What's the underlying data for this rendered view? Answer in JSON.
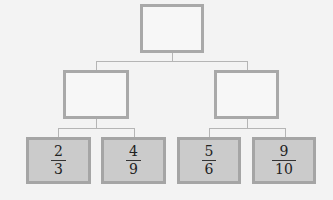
{
  "diagram": {
    "type": "tree",
    "root": {
      "label": ""
    },
    "level2": [
      {
        "label": ""
      },
      {
        "label": ""
      }
    ],
    "leaves": [
      {
        "numerator": "2",
        "denominator": "3"
      },
      {
        "numerator": "4",
        "denominator": "9"
      },
      {
        "numerator": "5",
        "denominator": "6"
      },
      {
        "numerator": "9",
        "denominator": "10"
      }
    ],
    "colors": {
      "background": "#f3f3f3",
      "border": "#a9a9a9",
      "leaf_fill": "#cbcbcb",
      "connector": "#b5b5b5"
    }
  }
}
